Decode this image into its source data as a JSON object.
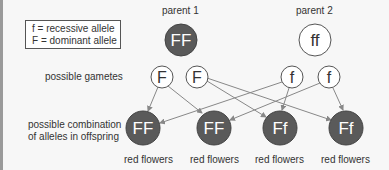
{
  "legend": {
    "recessive": "f = recessive allele",
    "dominant": "F = dominant allele"
  },
  "parents": [
    {
      "label": "parent 1",
      "genotype": "FF",
      "fill": "#5a5a5a"
    },
    {
      "label": "parent 2",
      "genotype": "ff",
      "fill": "#ffffff"
    }
  ],
  "row_labels": {
    "gametes": "possible gametes",
    "offspring_line1": "possible combination",
    "offspring_line2": "of alleles in offspring"
  },
  "gametes": [
    "F",
    "F",
    "f",
    "f"
  ],
  "offspring": [
    {
      "genotype": "FF",
      "phenotype": "red flowers"
    },
    {
      "genotype": "FF",
      "phenotype": "red flowers"
    },
    {
      "genotype": "Ff",
      "phenotype": "red flowers"
    },
    {
      "genotype": "Ff",
      "phenotype": "red flowers"
    }
  ],
  "colors": {
    "dark_circle": "#5a5a5a",
    "arrow": "#888888",
    "outline": "#555555"
  }
}
